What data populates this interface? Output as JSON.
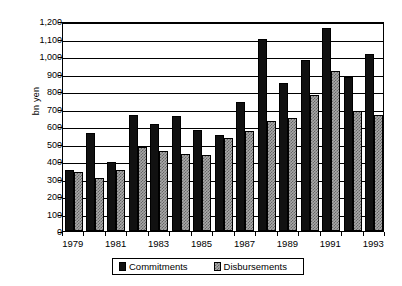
{
  "chart_data": {
    "type": "bar",
    "title": "",
    "xlabel": "",
    "ylabel": "bn yen",
    "ylim": [
      0,
      1200
    ],
    "ytick_step": 100,
    "grid": true,
    "legend_position": "bottom",
    "categories": [
      "1979",
      "1980",
      "1981",
      "1982",
      "1983",
      "1984",
      "1985",
      "1986",
      "1987",
      "1988",
      "1989",
      "1990",
      "1991",
      "1992",
      "1993"
    ],
    "xtick_labels_visible": [
      "1979",
      "1981",
      "1983",
      "1985",
      "1987",
      "1989",
      "1991",
      "1993"
    ],
    "ytick_labels": [
      "0",
      "100",
      "200",
      "300",
      "400",
      "500",
      "600",
      "700",
      "800",
      "900",
      "1,000",
      "1,100",
      "1,200"
    ],
    "series": [
      {
        "name": "Commitments",
        "color": "#111111",
        "values": [
          350,
          560,
          395,
          665,
          612,
          655,
          580,
          550,
          740,
          1100,
          848,
          978,
          1160,
          880,
          1012
        ]
      },
      {
        "name": "Disbursements",
        "color": "#a9a9a9",
        "values": [
          340,
          305,
          348,
          480,
          455,
          440,
          432,
          530,
          572,
          630,
          648,
          775,
          912,
          688,
          665
        ]
      }
    ]
  },
  "legend": {
    "entries": [
      {
        "label": "Commitments"
      },
      {
        "label": "Disbursements"
      }
    ]
  }
}
